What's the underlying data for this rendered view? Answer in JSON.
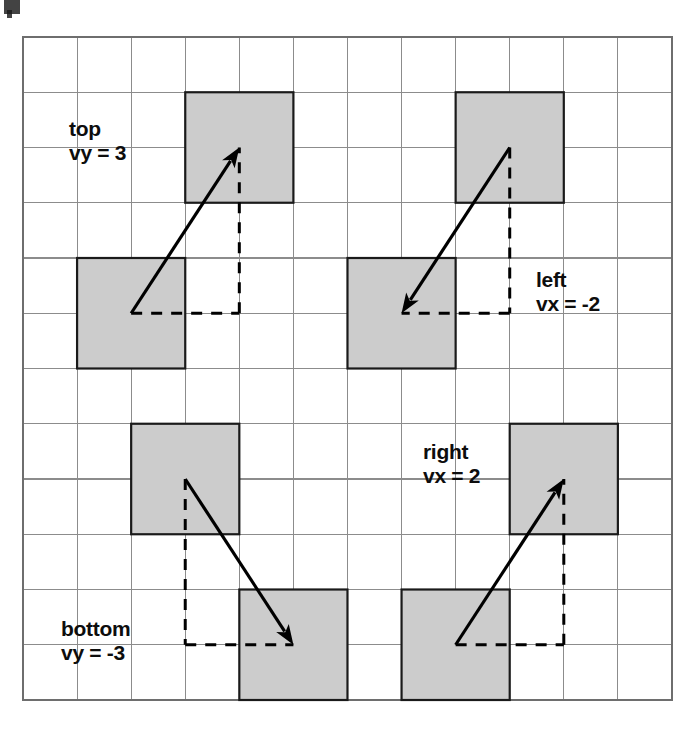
{
  "figure": {
    "background_color": "#ffffff",
    "grid": {
      "columns": 12,
      "rows": 12,
      "x0": 23,
      "y0": 37,
      "cell_width": 54.08,
      "cell_height": 55.25,
      "line_color": "#8c8c8c",
      "border_color": "#6e6e6e"
    },
    "square": {
      "fill_color": "#cccccc",
      "stroke_color": "#1a1a1a",
      "size_in_cells": 2
    },
    "arrow_color": "#000000",
    "vectors": [
      {
        "id": "top",
        "label_line1": "top",
        "label_line2": "vy = 3",
        "label_x": 69,
        "label_y": 136,
        "from_col": 1,
        "from_row": 4,
        "to_col": 3,
        "to_row": 1,
        "vx": 2,
        "vy": 3,
        "dash_mode": "horizontal-then-vertical"
      },
      {
        "id": "left",
        "label_line1": "left",
        "label_line2": "vx = -2",
        "label_x": 536,
        "label_y": 287,
        "from_col": 8,
        "from_row": 1,
        "to_col": 6,
        "to_row": 4,
        "vx": -2,
        "vy": -3,
        "dash_mode": "vertical-then-horizontal"
      },
      {
        "id": "bottom",
        "label_line1": "bottom",
        "label_line2": "vy = -3",
        "label_x": 61,
        "label_y": 636,
        "from_col": 2,
        "from_row": 7,
        "to_col": 4,
        "to_row": 10,
        "vx": 2,
        "vy": -3,
        "dash_mode": "vertical-then-horizontal"
      },
      {
        "id": "right",
        "label_line1": "right",
        "label_line2": "vx = 2",
        "label_x": 423,
        "label_y": 459,
        "from_col": 7,
        "from_row": 10,
        "to_col": 9,
        "to_row": 7,
        "vx": 2,
        "vy": 3,
        "dash_mode": "horizontal-then-vertical"
      }
    ]
  },
  "chart_data": {
    "type": "scatter",
    "xlabel": "",
    "ylabel": "",
    "grid": true,
    "xlim": [
      0,
      12
    ],
    "ylim": [
      0,
      12
    ],
    "annotations": [
      {
        "text": "top",
        "value": "vy = 3",
        "vx": 2,
        "vy": 3,
        "start_cell": [
          1,
          4
        ],
        "end_cell": [
          3,
          1
        ]
      },
      {
        "text": "left",
        "value": "vx = -2",
        "vx": -2,
        "vy": -3,
        "start_cell": [
          8,
          1
        ],
        "end_cell": [
          6,
          4
        ]
      },
      {
        "text": "bottom",
        "value": "vy = -3",
        "vx": 2,
        "vy": -3,
        "start_cell": [
          2,
          7
        ],
        "end_cell": [
          4,
          10
        ]
      },
      {
        "text": "right",
        "value": "vx = 2",
        "vx": 2,
        "vy": 3,
        "start_cell": [
          7,
          10
        ],
        "end_cell": [
          9,
          7
        ]
      }
    ],
    "legend": []
  }
}
